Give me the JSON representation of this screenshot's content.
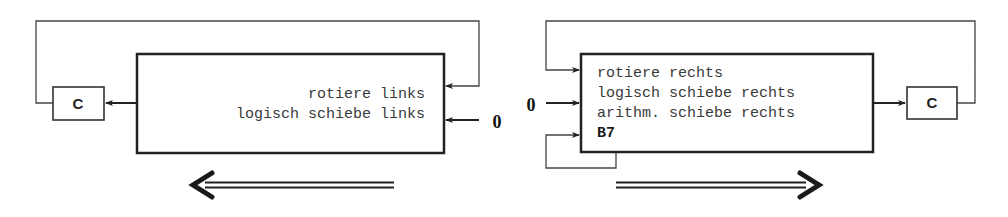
{
  "colors": {
    "line": "#222222",
    "thin_line": "#444444",
    "text": "#3a3a3a",
    "background": "#ffffff"
  },
  "left_diagram": {
    "title": "shift left",
    "box_lines": [
      "rotiere links",
      "logisch schiebe links"
    ],
    "carry_label": "C",
    "zero_input_label": "0",
    "direction_arrow": "left"
  },
  "right_diagram": {
    "title": "shift right",
    "box_lines": [
      "rotiere rechts",
      "logisch schiebe rechts",
      "arithm. schiebe rechts"
    ],
    "bit_label": "B7",
    "carry_label": "C",
    "zero_input_label": "0",
    "direction_arrow": "right"
  }
}
